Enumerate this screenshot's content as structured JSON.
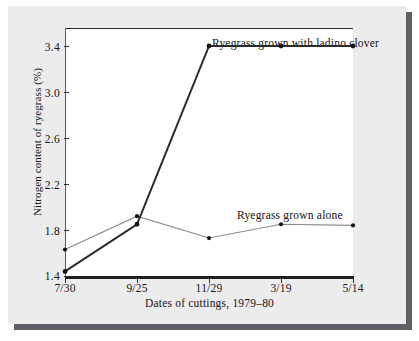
{
  "figure": {
    "background_color": "#ececed",
    "plot_background_color": "#ffffff",
    "shadow_color": "#5d5f64"
  },
  "chart_data": {
    "type": "line",
    "title": "",
    "xlabel": "Dates of cuttings, 1979–80",
    "ylabel": "Nitrogen content of ryegrass (%)",
    "categories": [
      "7/30",
      "9/25",
      "11/29",
      "3/19",
      "5/14"
    ],
    "xtick_labels": [
      "7/30",
      "9/25",
      "11/29",
      "3/19",
      "5/14"
    ],
    "ytick_labels": [
      "1.4",
      "1.8",
      "2.2",
      "2.6",
      "3.0",
      "3.4"
    ],
    "ytick_values": [
      1.4,
      1.8,
      2.2,
      2.6,
      3.0,
      3.4
    ],
    "ylim": [
      1.4,
      3.58
    ],
    "xlim": [
      0,
      4
    ],
    "grid": false,
    "legend_position": "inline-annotations",
    "series": [
      {
        "name": "Ryegrass grown with ladino clover",
        "color": "#2b2b2b",
        "line_width": 2.0,
        "marker": "circle",
        "values": [
          1.44,
          1.85,
          3.4,
          3.4,
          3.4
        ]
      },
      {
        "name": "Ryegrass grown alone",
        "color": "#8a8a8a",
        "line_width": 1.1,
        "marker": "circle",
        "values": [
          1.63,
          1.92,
          1.73,
          1.85,
          1.84
        ]
      }
    ],
    "annotations": [
      {
        "id": "clover",
        "text": "Ryegrass grown with ladino clover",
        "series": "Ryegrass grown with ladino clover"
      },
      {
        "id": "alone",
        "text": "Ryegrass grown alone",
        "series": "Ryegrass grown alone"
      }
    ]
  }
}
